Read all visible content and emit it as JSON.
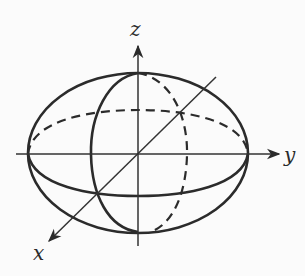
{
  "diagram": {
    "axes": [
      {
        "id": "x",
        "label": "x"
      },
      {
        "id": "y",
        "label": "y"
      },
      {
        "id": "z",
        "label": "z"
      }
    ],
    "shape": "ellipsoid",
    "curves": [
      {
        "id": "outline",
        "style": "solid"
      },
      {
        "id": "equator-front",
        "style": "solid"
      },
      {
        "id": "equator-back",
        "style": "dashed"
      },
      {
        "id": "meridian-front",
        "style": "solid"
      },
      {
        "id": "meridian-back",
        "style": "dashed"
      }
    ],
    "colors": {
      "ink": "#2b2b2b",
      "background": "#fbfbfb"
    }
  }
}
